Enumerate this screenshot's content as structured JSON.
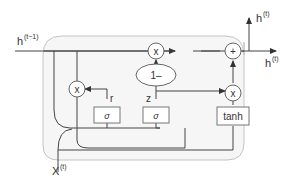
{
  "diagram": {
    "inputs": {
      "h_prev": {
        "base": "h",
        "sup": "(t−1)"
      },
      "x_t": {
        "base": "X",
        "sup": "(t)"
      }
    },
    "outputs": {
      "h_up": {
        "base": "h",
        "sup": "(t)"
      },
      "h_right": {
        "base": "h",
        "sup": "(t)"
      }
    },
    "gates": {
      "sigma_r": "σ",
      "sigma_z": "σ",
      "tanh": "tanh"
    },
    "operators": {
      "mult_r": "x",
      "mult_top": "x",
      "mult_tanh": "x",
      "add": "+",
      "one_minus": "1–"
    },
    "signals": {
      "r": "r",
      "z": "z"
    },
    "colors": {
      "line": "#444444",
      "cell_border": "#bdbdbd",
      "cell_fill": "#f4f4f4",
      "box_border": "#666666"
    }
  }
}
